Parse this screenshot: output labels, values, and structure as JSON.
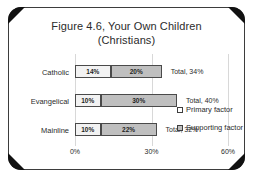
{
  "chart_data": {
    "type": "bar",
    "orientation": "horizontal",
    "stacked": true,
    "title": "Figure 4.6, Your Own Children",
    "subtitle": "(Christians)",
    "xlabel": "",
    "ylabel": "",
    "xlim": [
      0,
      60
    ],
    "xticks": [
      0,
      30,
      60
    ],
    "xtick_labels": [
      "0%",
      "30%",
      "60%"
    ],
    "grid": true,
    "legend_position": "right",
    "categories": [
      "Catholic",
      "Evangelical",
      "Mainline"
    ],
    "series": [
      {
        "name": "Primary factor",
        "values": [
          14,
          10,
          10
        ],
        "color": "#f2f2f2"
      },
      {
        "name": "Supporting factor",
        "values": [
          20,
          30,
          22
        ],
        "color": "#bfbfbf"
      }
    ],
    "totals": [
      34,
      40,
      32
    ],
    "rows": [
      {
        "category": "Catholic",
        "primary": 14,
        "supporting": 20,
        "primary_label": "14%",
        "supporting_label": "20%",
        "total_label": "Total, 34%"
      },
      {
        "category": "Evangelical",
        "primary": 10,
        "supporting": 30,
        "primary_label": "10%",
        "supporting_label": "30%",
        "total_label": "Total, 40%"
      },
      {
        "category": "Mainline",
        "primary": 10,
        "supporting": 22,
        "primary_label": "10%",
        "supporting_label": "22%",
        "total_label": "Total, 32%"
      }
    ]
  },
  "legend": {
    "items": [
      {
        "label": "Primary factor",
        "swatch": "primary"
      },
      {
        "label": "Supporting factor",
        "swatch": "supporting"
      }
    ]
  },
  "colors": {
    "primary_fill": "#f2f2f2",
    "supporting_fill": "#bfbfbf",
    "bar_border": "#4a4a4a",
    "frame_border": "#3d3d3d",
    "corner_accent": "#111111",
    "gridline": "#d8d8d8",
    "text": "#2b2b2b",
    "background": "#ffffff"
  }
}
